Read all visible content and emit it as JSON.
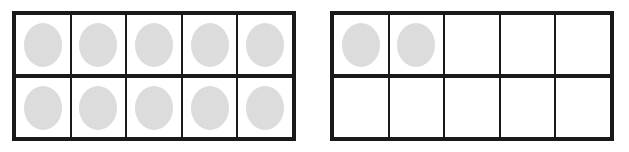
{
  "canvas": {
    "width": 629,
    "height": 152,
    "background": "#ffffff"
  },
  "style": {
    "border_color": "#191919",
    "counter_color": "#dcdcdc",
    "cell_background": "#ffffff",
    "outer_border_px": 4,
    "inner_line_px": 2
  },
  "frames": [
    {
      "name": "left-ten-frame",
      "rows": 2,
      "columns": 5,
      "filled_count": 10,
      "empty_count": 0,
      "position": {
        "left": 12,
        "top": 11,
        "width": 284,
        "height": 130
      },
      "cells": [
        [
          true,
          true,
          true,
          true,
          true
        ],
        [
          true,
          true,
          true,
          true,
          true
        ]
      ]
    },
    {
      "name": "right-ten-frame",
      "rows": 2,
      "columns": 5,
      "filled_count": 2,
      "empty_count": 8,
      "position": {
        "left": 330,
        "top": 11,
        "width": 284,
        "height": 130
      },
      "cells": [
        [
          true,
          true,
          false,
          false,
          false
        ],
        [
          false,
          false,
          false,
          false,
          false
        ]
      ]
    }
  ]
}
